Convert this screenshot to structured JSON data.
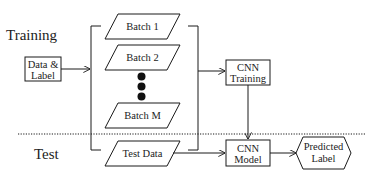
{
  "diagram": {
    "sections": {
      "training": "Training",
      "test": "Test"
    },
    "nodes": {
      "data_label": [
        "Data &",
        "Label"
      ],
      "batch1": "Batch 1",
      "batch2": "Batch 2",
      "batchM": "Batch M",
      "cnn_training": [
        "CNN",
        "Training"
      ],
      "test_data": "Test Data",
      "cnn_model": [
        "CNN",
        "Model"
      ],
      "predicted_label": [
        "Predicted",
        "Label"
      ]
    },
    "edges": [
      {
        "from": "data_label",
        "to": "batches"
      },
      {
        "from": "batches",
        "to": "cnn_training"
      },
      {
        "from": "cnn_training",
        "to": "cnn_model"
      },
      {
        "from": "test_data",
        "to": "cnn_model"
      },
      {
        "from": "cnn_model",
        "to": "predicted_label"
      }
    ],
    "colors": {
      "stroke": "#1a1a1a",
      "background": "#ffffff",
      "text": "#222222"
    }
  }
}
